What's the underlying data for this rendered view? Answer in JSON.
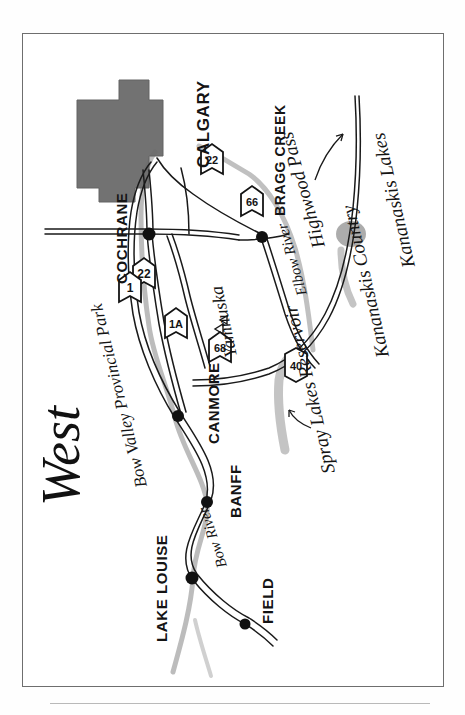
{
  "map": {
    "title": "West",
    "orientation_note": "rotated",
    "colors": {
      "ink": "#141414",
      "city_fill": "#6b6b6b",
      "water": "#a9a9a9",
      "frame": "#6e6e6e",
      "paper": "#ffffff"
    },
    "cities": [
      {
        "id": "lake-louise",
        "label": "LAKE LOUISE",
        "x": 108,
        "y": 168
      },
      {
        "id": "field",
        "label": "FIELD",
        "x": 62,
        "y": 222
      },
      {
        "id": "banff",
        "label": "BANFF",
        "x": 196,
        "y": 180
      },
      {
        "id": "canmore",
        "label": "CANMORE",
        "x": 268,
        "y": 150
      },
      {
        "id": "cochrane",
        "label": "COCHRANE",
        "x": 446,
        "y": 118
      },
      {
        "id": "bragg-creek",
        "label": "BRAGG CREEK",
        "x": 452,
        "y": 236
      },
      {
        "id": "calgary",
        "label": "CALGARY",
        "x": 540,
        "y": 160
      }
    ],
    "areas": [
      {
        "id": "bow-valley-provincial-park",
        "label": "Bow Valley Provincial Park"
      },
      {
        "id": "kananaskis-country",
        "label": "Kananaskis Country"
      },
      {
        "id": "kananaskis-lakes",
        "label": "Kananaskis Lakes"
      },
      {
        "id": "yamnuska",
        "label": "Yamnuska"
      },
      {
        "id": "highwood-pass",
        "label": "Highwood Pass"
      },
      {
        "id": "spray-lakes-reservoir",
        "label": "Spray Lakes Reservoir"
      }
    ],
    "waterways": [
      {
        "id": "bow-river",
        "label": "Bow River"
      },
      {
        "id": "elbow-river",
        "label": "Elbow River"
      }
    ],
    "highways": [
      {
        "id": "hwy-22-north",
        "number": "22"
      },
      {
        "id": "hwy-22-south",
        "number": "22"
      },
      {
        "id": "hwy-1a",
        "number": "1A"
      },
      {
        "id": "hwy-1",
        "number": "1"
      },
      {
        "id": "hwy-68",
        "number": "68"
      },
      {
        "id": "hwy-66",
        "number": "66"
      },
      {
        "id": "hwy-40",
        "number": "40"
      }
    ]
  }
}
